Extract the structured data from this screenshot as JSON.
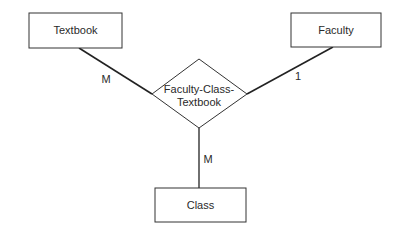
{
  "diagram": {
    "type": "entity-relationship",
    "entities": [
      {
        "id": "textbook",
        "label": "Textbook"
      },
      {
        "id": "faculty",
        "label": "Faculty"
      },
      {
        "id": "class",
        "label": "Class"
      }
    ],
    "relationship": {
      "id": "faculty-class-textbook",
      "label_line1": "Faculty-Class-",
      "label_line2": "Textbook"
    },
    "connections": [
      {
        "from": "textbook",
        "to": "faculty-class-textbook",
        "cardinality": "M"
      },
      {
        "from": "faculty",
        "to": "faculty-class-textbook",
        "cardinality": "1"
      },
      {
        "from": "class",
        "to": "faculty-class-textbook",
        "cardinality": "M"
      }
    ]
  }
}
